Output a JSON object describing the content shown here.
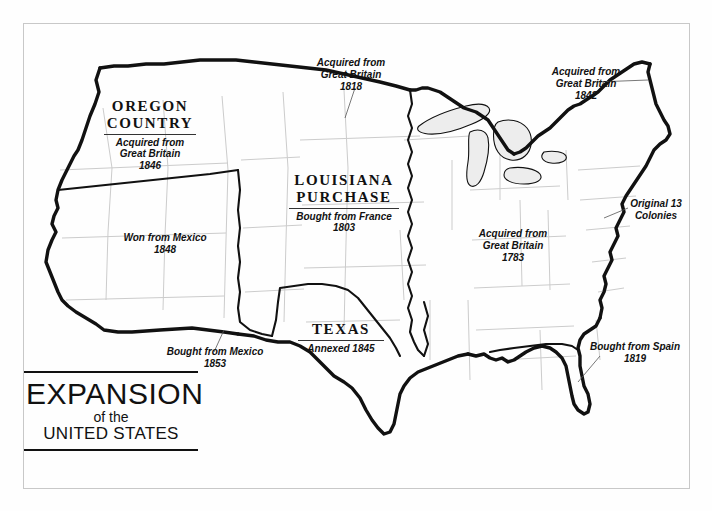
{
  "document": {
    "kind": "historical-map",
    "title_block": {
      "line1": "EXPANSION",
      "line2": "of the",
      "line3": "UNITED STATES"
    }
  },
  "map": {
    "subject": "Territorial expansion of the United States",
    "colors": {
      "background": "#fefefe",
      "acquisition_boundary": "#111111",
      "state_boundary": "#cccccc",
      "lake_fill": "#ededed",
      "frame": "#c8c8c8",
      "text": "#111111"
    },
    "regions": [
      {
        "name": "oregon-country",
        "title_line1": "OREGON",
        "title_line2": "COUNTRY",
        "sub_line1": "Acquired from",
        "sub_line2": "Great Britain",
        "year": "1846"
      },
      {
        "name": "louisiana-purchase",
        "title_line1": "LOUISIANA",
        "title_line2": "PURCHASE",
        "sub_line1": "Bought from France",
        "sub_line2": "",
        "year": "1803"
      },
      {
        "name": "texas",
        "title_line1": "TEXAS",
        "title_line2": "",
        "sub_line1": "Annexed 1845",
        "sub_line2": "",
        "year": ""
      }
    ],
    "annotations": [
      {
        "name": "red-river-cession-1818",
        "line1": "Acquired from",
        "line2": "Great Britain",
        "line3": "1818",
        "leader": true
      },
      {
        "name": "webster-ashburton-1842",
        "line1": "Acquired from",
        "line2": "Great Britain",
        "line3": "1842",
        "leader": true
      },
      {
        "name": "mexican-cession-1848",
        "line1": "Won from Mexico",
        "line2": "1848",
        "line3": "",
        "leader": false
      },
      {
        "name": "gadsden-purchase-1853",
        "line1": "Bought from Mexico",
        "line2": "1853",
        "line3": "",
        "leader": true
      },
      {
        "name": "treaty-of-paris-1783",
        "line1": "Acquired from",
        "line2": "Great Britain",
        "line3": "1783",
        "leader": false
      },
      {
        "name": "original-thirteen-colonies",
        "line1": "Original 13",
        "line2": "Colonies",
        "line3": "",
        "leader": true
      },
      {
        "name": "florida-purchase-1819",
        "line1": "Bought from Spain",
        "line2": "1819",
        "line3": "",
        "leader": true
      }
    ]
  }
}
